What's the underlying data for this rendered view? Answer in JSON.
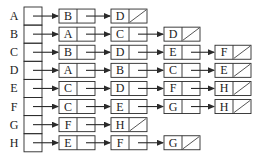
{
  "diagram": {
    "type": "adjacency-list",
    "colors": {
      "line": "#2a2a2a",
      "background": "#ffffff",
      "text": "#222222"
    },
    "rows": [
      {
        "vertex": "A",
        "neighbors": [
          "B",
          "D"
        ]
      },
      {
        "vertex": "B",
        "neighbors": [
          "A",
          "C",
          "D"
        ]
      },
      {
        "vertex": "C",
        "neighbors": [
          "B",
          "D",
          "E",
          "F"
        ]
      },
      {
        "vertex": "D",
        "neighbors": [
          "A",
          "B",
          "C",
          "E"
        ]
      },
      {
        "vertex": "E",
        "neighbors": [
          "C",
          "D",
          "F",
          "H"
        ]
      },
      {
        "vertex": "F",
        "neighbors": [
          "C",
          "E",
          "G",
          "H"
        ]
      },
      {
        "vertex": "G",
        "neighbors": [
          "F",
          "H"
        ]
      },
      {
        "vertex": "H",
        "neighbors": [
          "E",
          "F",
          "G"
        ]
      }
    ]
  }
}
